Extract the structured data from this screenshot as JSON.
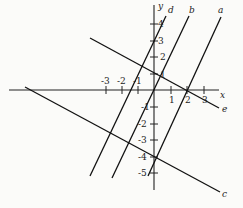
{
  "diagram": {
    "type": "coordinate-plane-lines",
    "axes": {
      "x_label": "x",
      "y_label": "y",
      "x_ticks": [
        "-3",
        "-2",
        "-1",
        "1",
        "2",
        "3"
      ],
      "y_ticks": [
        "4",
        "3",
        "2",
        "1",
        "-1",
        "-2",
        "-3",
        "-4",
        "-5"
      ]
    },
    "lines": [
      {
        "label": "a"
      },
      {
        "label": "b"
      },
      {
        "label": "d"
      },
      {
        "label": "e"
      },
      {
        "label": "c"
      }
    ]
  }
}
